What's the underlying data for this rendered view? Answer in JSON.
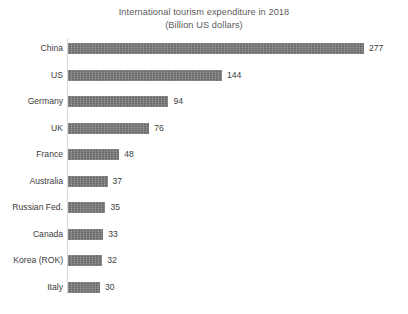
{
  "chart_data": {
    "type": "bar",
    "orientation": "horizontal",
    "title": "International tourism expenditure in 2018",
    "subtitle": "(Billion US dollars)",
    "xlabel": "",
    "ylabel": "",
    "xlim": [
      0,
      277
    ],
    "grid": false,
    "legend": false,
    "value_labels": true,
    "bar_color": "#7b7b7b",
    "text_color": "#3c3c3c",
    "title_color": "#5a5a5a",
    "background_color": "#ffffff",
    "categories": [
      "China",
      "US",
      "Germany",
      "UK",
      "France",
      "Australia",
      "Russian Fed.",
      "Canada",
      "Korea (ROK)",
      "Italy"
    ],
    "values": [
      277,
      144,
      94,
      76,
      48,
      37,
      35,
      33,
      32,
      30
    ],
    "units": "Billion US dollars",
    "rows": [
      {
        "category": "China",
        "value": 277,
        "value_text": "277"
      },
      {
        "category": "US",
        "value": 144,
        "value_text": "144"
      },
      {
        "category": "Germany",
        "value": 94,
        "value_text": "94"
      },
      {
        "category": "UK",
        "value": 76,
        "value_text": "76"
      },
      {
        "category": "France",
        "value": 48,
        "value_text": "48"
      },
      {
        "category": "Australia",
        "value": 37,
        "value_text": "37"
      },
      {
        "category": "Russian Fed.",
        "value": 35,
        "value_text": "35"
      },
      {
        "category": "Canada",
        "value": 33,
        "value_text": "33"
      },
      {
        "category": "Korea (ROK)",
        "value": 32,
        "value_text": "32"
      },
      {
        "category": "Italy",
        "value": 30,
        "value_text": "30"
      }
    ]
  }
}
